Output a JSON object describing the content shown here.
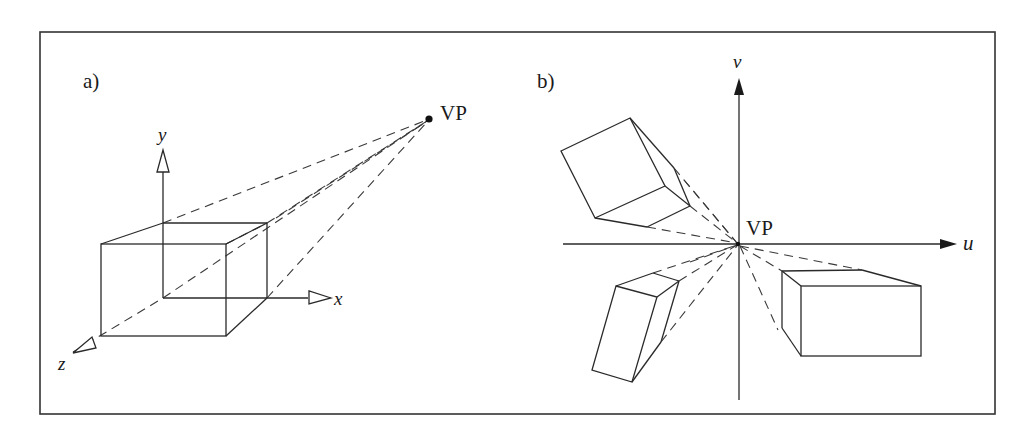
{
  "figure": {
    "panels": [
      {
        "id": "a",
        "label": "a)",
        "vp_label": "VP",
        "axes": {
          "x": "x",
          "y": "y",
          "z": "z"
        },
        "description": "3D cube with axes x, y, z; edges parallel to z converge at vanishing point VP"
      },
      {
        "id": "b",
        "label": "b)",
        "vp_label": "VP",
        "axes": {
          "u": "u",
          "v": "v"
        },
        "description": "Image plane (u,v) with three boxes whose receding edges converge to VP at origin"
      }
    ]
  }
}
